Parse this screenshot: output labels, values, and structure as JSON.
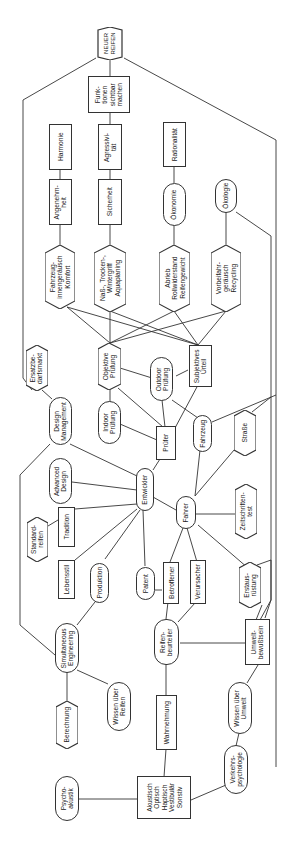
{
  "diagram": {
    "title": "NEUER REIFEN",
    "orientation": "rotated -90deg (text reads bottom-to-top)",
    "nodes": [
      {
        "id": "neuer_reifen",
        "shape": "hexagon",
        "label": "NEUER\nREIFEN"
      },
      {
        "id": "funktionen",
        "shape": "rect",
        "label": "Funk-\ntionen\nsichtbar\nmachen"
      },
      {
        "id": "harmonie",
        "shape": "rect",
        "label": "Harmonie"
      },
      {
        "id": "aggressivitaet",
        "shape": "rect",
        "label": "Agressivi-\ntät"
      },
      {
        "id": "rationalitaet",
        "shape": "rect",
        "label": "Rationalität"
      },
      {
        "id": "angenehmheit",
        "shape": "rect",
        "label": "Angenehm-\nheit"
      },
      {
        "id": "sicherheit",
        "shape": "rect",
        "label": "Sicherheit"
      },
      {
        "id": "oekonomie",
        "shape": "rounded",
        "label": "Ökonomie"
      },
      {
        "id": "oekologie",
        "shape": "rounded",
        "label": "Ökologie"
      },
      {
        "id": "fahrzeug_komfort",
        "shape": "hexagon",
        "label": "Fahrzeug-\ninnengeräusch\nKomfort"
      },
      {
        "id": "nass_trocken",
        "shape": "hexagon",
        "label": "Naß-, Trocken-,\nWintergriff\nAquaplaning"
      },
      {
        "id": "abrieb",
        "shape": "hexagon",
        "label": "Abrieb\nRollwiderstand\nReifengewicht"
      },
      {
        "id": "vorbeifahr",
        "shape": "hexagon",
        "label": "Vorbeifahr-\ngeräusch\nRecycling"
      },
      {
        "id": "ersatzbedarf",
        "shape": "hexagon",
        "label": "Ersatzbe-\ndarfsmarkt"
      },
      {
        "id": "objektive",
        "shape": "hexagon",
        "label": "Objektive\nPrüfung"
      },
      {
        "id": "outdoor",
        "shape": "rounded",
        "label": "Outdoor\nPrüfung"
      },
      {
        "id": "subjektives",
        "shape": "rect",
        "label": "Subjektives\nUrteil"
      },
      {
        "id": "design_mgmt",
        "shape": "rounded",
        "label": "Design\nManagement"
      },
      {
        "id": "indoor",
        "shape": "rounded",
        "label": "Indoor\nPrüfung"
      },
      {
        "id": "pruefer",
        "shape": "rect",
        "label": "Prüfer"
      },
      {
        "id": "fahrzeug",
        "shape": "rounded",
        "label": "Fahrzeug"
      },
      {
        "id": "strasse",
        "shape": "hexagon",
        "label": "Straße"
      },
      {
        "id": "advanced_design",
        "shape": "rounded",
        "label": "Advanced\nDesign"
      },
      {
        "id": "entwickler",
        "shape": "rounded",
        "label": "Entwickler"
      },
      {
        "id": "fahrer",
        "shape": "rounded",
        "label": "Fahrer"
      },
      {
        "id": "zeitschriften",
        "shape": "hexagon",
        "label": "Zeitschriften-\ntest"
      },
      {
        "id": "standardreifen",
        "shape": "hexagon",
        "label": "Standard-\nreifen"
      },
      {
        "id": "tradition",
        "shape": "rect",
        "label": "Tradition"
      },
      {
        "id": "lebensstil",
        "shape": "rect",
        "label": "Lebensstil"
      },
      {
        "id": "produktion",
        "shape": "rounded",
        "label": "Produktion"
      },
      {
        "id": "patent",
        "shape": "rounded",
        "label": "Patent"
      },
      {
        "id": "betroffener",
        "shape": "rect",
        "label": "Betroffener"
      },
      {
        "id": "verursacher",
        "shape": "rect",
        "label": "Verursacher"
      },
      {
        "id": "erstausruestung",
        "shape": "hexagon",
        "label": "Erstaus-\nrüstung"
      },
      {
        "id": "simultaneous",
        "shape": "rounded",
        "label": "Simultaneous\nEngineering"
      },
      {
        "id": "reifenbeurteiler",
        "shape": "rounded",
        "label": "Reifen-\nbeurteiler"
      },
      {
        "id": "umweltbewusstsein",
        "shape": "rect",
        "label": "Umwelt-\nbewußtsein"
      },
      {
        "id": "berechnung",
        "shape": "hexagon",
        "label": "Berechnung"
      },
      {
        "id": "wissen_reifen",
        "shape": "rounded",
        "label": "Wissen über\nReifen"
      },
      {
        "id": "wahrnehmung",
        "shape": "rect",
        "label": "Wahrnehmung"
      },
      {
        "id": "wissen_umwelt",
        "shape": "rounded",
        "label": "Wissen über\nUmwelt"
      },
      {
        "id": "psychoakustik",
        "shape": "rounded",
        "label": "Psycho-\nakustik"
      },
      {
        "id": "akustisch",
        "shape": "rect",
        "label": "Akustisch\nOptisch\nHaptisch\nVestibulär\nSonstiv"
      },
      {
        "id": "verkehrspsychologie",
        "shape": "rounded",
        "label": "Verkehrs-\npsychologie"
      }
    ]
  }
}
